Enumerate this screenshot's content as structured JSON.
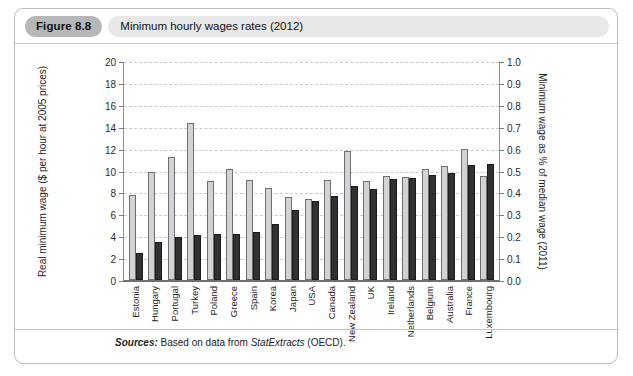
{
  "header": {
    "figure_number": "Figure 8.8",
    "title": "Minimum hourly wages rates (2012)"
  },
  "source": {
    "label": "Sources:",
    "text_before": " Based on data from ",
    "source_name": "StatExtracts",
    "text_after": " (OECD)."
  },
  "colors": {
    "light_bar": "#d2d3d5",
    "dark_bar": "#2f3133",
    "grid": "#c9cbce",
    "axis": "#6e7073",
    "badge": "#b6b7b9",
    "pill": "#e8e8e8"
  },
  "chart_data": {
    "type": "bar",
    "title": "Minimum hourly wages rates (2012)",
    "xlabel": "",
    "ylabel": "Real minimum wage ($ per hour at 2005 prices)",
    "y2label": "Minimum wage as % of median wage (2011)",
    "ylim": [
      0,
      20
    ],
    "y2lim": [
      0.0,
      1.0
    ],
    "yticks": [
      "0",
      "2",
      "4",
      "6",
      "8",
      "10",
      "12",
      "14",
      "16",
      "18",
      "20"
    ],
    "y2ticks": [
      "0.0",
      "0.1",
      "0.2",
      "0.3",
      "0.4",
      "0.5",
      "0.6",
      "0.7",
      "0.8",
      "0.9",
      "1.0"
    ],
    "grid": true,
    "legend": "none",
    "categories": [
      "Estonia",
      "Hungary",
      "Portugal",
      "Turkey",
      "Poland",
      "Greece",
      "Spain",
      "Korea",
      "Japan",
      "USA",
      "Canada",
      "New Zealand",
      "UK",
      "Ireland",
      "Netherlands",
      "Belgium",
      "Australia",
      "France",
      "Luxembourg"
    ],
    "series": [
      {
        "name": "Real minimum wage ($ per hour at 2005 prices)",
        "axis": "left",
        "color": "#d2d3d5",
        "values": [
          7.8,
          9.9,
          11.2,
          14.3,
          9.0,
          10.1,
          9.1,
          8.4,
          7.6,
          7.4,
          9.1,
          11.8,
          9.0,
          9.5,
          9.4,
          10.1,
          10.4,
          12.0,
          9.5
        ]
      },
      {
        "name": "Minimum wage as % of median wage (2011)",
        "axis": "right",
        "color": "#2f3133",
        "values": [
          0.125,
          0.175,
          0.195,
          0.205,
          0.21,
          0.21,
          0.22,
          0.255,
          0.32,
          0.36,
          0.385,
          0.43,
          0.415,
          0.46,
          0.465,
          0.48,
          0.49,
          0.525,
          0.53
        ]
      }
    ]
  }
}
